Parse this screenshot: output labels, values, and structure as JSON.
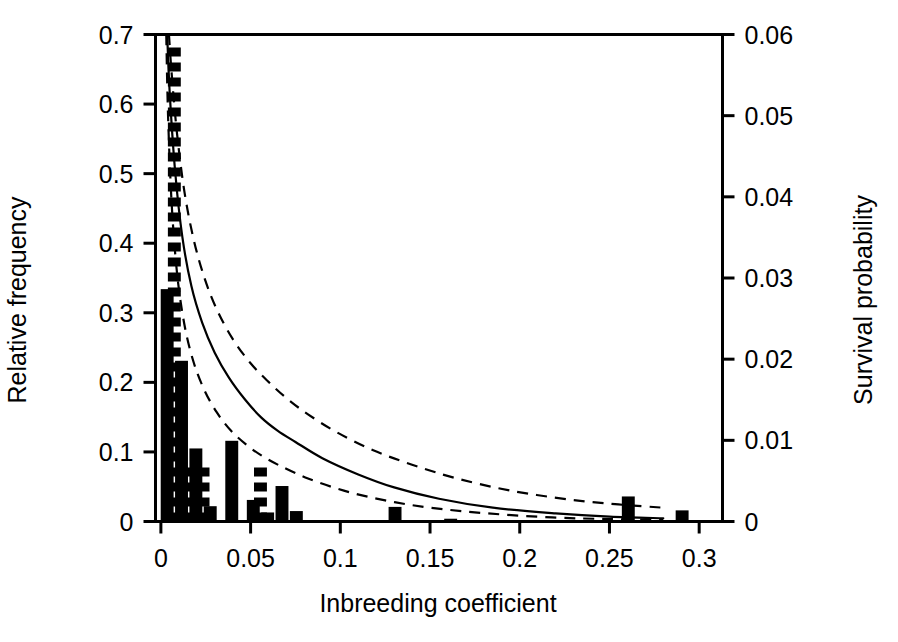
{
  "figure": {
    "background_color": "#ffffff",
    "ink_color": "#000000"
  },
  "chart_data": {
    "type": "bar",
    "title": "",
    "subtitle": "",
    "xlabel": "Inbreeding coefficient",
    "ylabel": "Relative frequency",
    "y2label": "Survival probability",
    "xlim": [
      -0.003,
      0.313
    ],
    "ylim": [
      0,
      0.7
    ],
    "y2lim": [
      0,
      0.06
    ],
    "grid": false,
    "legend_position": "none",
    "xticks": [
      0,
      0.05,
      0.1,
      0.15,
      0.2,
      0.25,
      0.3
    ],
    "xtick_labels": [
      "0",
      "0.05",
      "0.1",
      "0.15",
      "0.2",
      "0.25",
      "0.3"
    ],
    "yticks": [
      0,
      0.1,
      0.2,
      0.3,
      0.4,
      0.5,
      0.6,
      0.7
    ],
    "ytick_labels": [
      "0",
      "0.1",
      "0.2",
      "0.3",
      "0.4",
      "0.5",
      "0.6",
      "0.7"
    ],
    "y2ticks": [
      0,
      0.01,
      0.02,
      0.03,
      0.04,
      0.05,
      0.06
    ],
    "y2tick_labels": [
      "0",
      "0.01",
      "0.02",
      "0.03",
      "0.04",
      "0.05",
      "0.06"
    ],
    "bar_width": 0.0072,
    "series": [
      {
        "name": "Solid histogram",
        "axis": "left",
        "fill": "solid",
        "x": [
          0.0035,
          0.0115,
          0.0195,
          0.0275,
          0.0395,
          0.0515,
          0.0595,
          0.0675,
          0.0755,
          0.1305,
          0.1615,
          0.2605,
          0.2905
        ],
        "values": [
          0.334,
          0.231,
          0.105,
          0.022,
          0.116,
          0.031,
          0.013,
          0.051,
          0.015,
          0.021,
          0.004,
          0.036,
          0.016
        ]
      },
      {
        "name": "Hatched histogram",
        "axis": "left",
        "fill": "hatched",
        "x": [
          0.0075,
          0.0155,
          0.0235,
          0.0555
        ],
        "values": [
          0.72,
          0.099,
          0.095,
          0.098
        ],
        "clipped_above_ylim": [
          true,
          false,
          false,
          false
        ]
      }
    ],
    "curves": [
      {
        "name": "Survival probability fitted",
        "axis": "right",
        "style": "solid",
        "x": [
          0.0035,
          0.005,
          0.008,
          0.012,
          0.017,
          0.023,
          0.03,
          0.038,
          0.047,
          0.056,
          0.065,
          0.075,
          0.09,
          0.11,
          0.13,
          0.155,
          0.185,
          0.22,
          0.25,
          0.28
        ],
        "values": [
          0.06,
          0.0525,
          0.043,
          0.035,
          0.029,
          0.0245,
          0.0208,
          0.0177,
          0.015,
          0.0128,
          0.0112,
          0.0098,
          0.0078,
          0.0058,
          0.0042,
          0.0028,
          0.0017,
          0.001,
          0.0006,
          0.0004
        ]
      },
      {
        "name": "Upper confidence limit",
        "axis": "right",
        "style": "dashed",
        "x": [
          0.0045,
          0.006,
          0.009,
          0.013,
          0.018,
          0.024,
          0.031,
          0.04,
          0.05,
          0.06,
          0.07,
          0.082,
          0.098,
          0.118,
          0.14,
          0.165,
          0.195,
          0.228,
          0.255,
          0.28
        ],
        "values": [
          0.06,
          0.0552,
          0.0478,
          0.0408,
          0.035,
          0.0302,
          0.0262,
          0.0225,
          0.0195,
          0.0172,
          0.0152,
          0.0132,
          0.011,
          0.0088,
          0.007,
          0.0053,
          0.0038,
          0.0027,
          0.0021,
          0.0017
        ]
      },
      {
        "name": "Lower confidence limit",
        "axis": "right",
        "style": "dashed",
        "x": [
          0.003,
          0.004,
          0.006,
          0.009,
          0.013,
          0.018,
          0.024,
          0.031,
          0.039,
          0.048,
          0.057,
          0.067,
          0.082,
          0.102,
          0.125,
          0.15,
          0.182,
          0.218,
          0.25,
          0.28
        ],
        "values": [
          0.06,
          0.05,
          0.0392,
          0.0306,
          0.0244,
          0.0198,
          0.0163,
          0.0135,
          0.0112,
          0.0094,
          0.008,
          0.0068,
          0.0053,
          0.0038,
          0.0026,
          0.0017,
          0.001,
          0.0005,
          0.0003,
          0.0002
        ]
      }
    ]
  }
}
